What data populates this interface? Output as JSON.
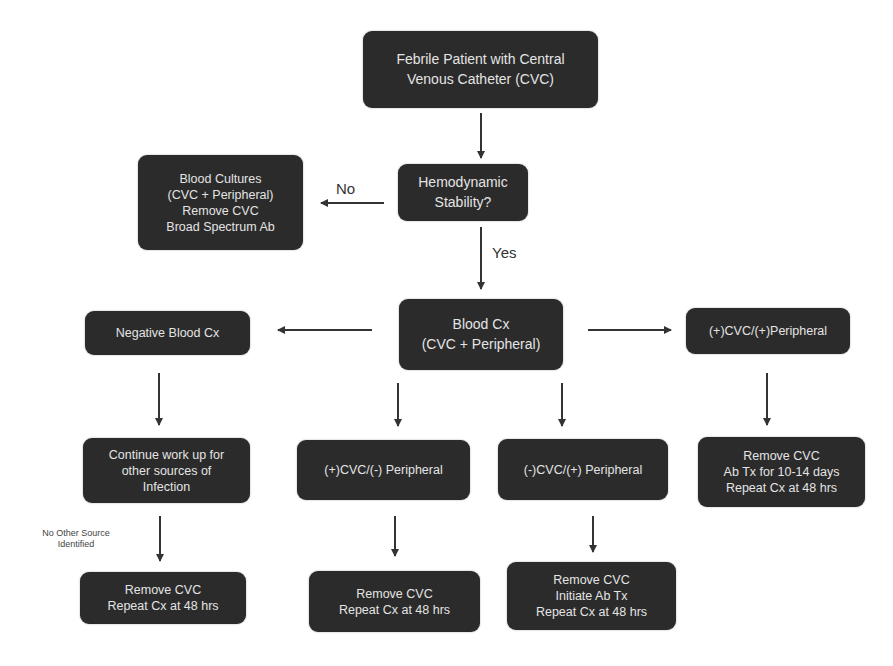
{
  "diagram": {
    "type": "flowchart",
    "nodes": {
      "start": {
        "lines": [
          "Febrile Patient with Central",
          "Venous Catheter (CVC)"
        ]
      },
      "hemodynamic": {
        "lines": [
          "Hemodynamic",
          "Stability?"
        ]
      },
      "unstable": {
        "lines": [
          "Blood Cultures",
          "(CVC + Peripheral)",
          "Remove CVC",
          "Broad Spectrum Ab"
        ]
      },
      "blood_cx": {
        "lines": [
          "Blood Cx",
          "(CVC + Peripheral)"
        ]
      },
      "negative": {
        "lines": [
          "Negative Blood Cx"
        ]
      },
      "pos_pos": {
        "lines": [
          "(+)CVC/(+)Peripheral"
        ]
      },
      "continue_workup": {
        "lines": [
          "Continue work up for",
          "other sources of",
          "Infection"
        ]
      },
      "pos_neg": {
        "lines": [
          "(+)CVC/(-) Peripheral"
        ]
      },
      "neg_pos": {
        "lines": [
          "(-)CVC/(+) Peripheral"
        ]
      },
      "pos_pos_action": {
        "lines": [
          "Remove CVC",
          "Ab Tx for 10-14 days",
          "Repeat Cx at 48 hrs"
        ]
      },
      "workup_action": {
        "lines": [
          "Remove CVC",
          "Repeat Cx at 48 hrs"
        ]
      },
      "pos_neg_action": {
        "lines": [
          "Remove CVC",
          "Repeat Cx at 48 hrs"
        ]
      },
      "neg_pos_action": {
        "lines": [
          "Remove CVC",
          "Initiate Ab Tx",
          "Repeat Cx at 48 hrs"
        ]
      }
    },
    "edge_labels": {
      "no": "No",
      "yes": "Yes",
      "no_other_source": [
        "No Other Source",
        "Identified"
      ]
    },
    "edges": [
      [
        "start",
        "hemodynamic"
      ],
      [
        "hemodynamic",
        "unstable",
        "No"
      ],
      [
        "hemodynamic",
        "blood_cx",
        "Yes"
      ],
      [
        "blood_cx",
        "negative"
      ],
      [
        "blood_cx",
        "pos_pos"
      ],
      [
        "blood_cx",
        "pos_neg"
      ],
      [
        "blood_cx",
        "neg_pos"
      ],
      [
        "negative",
        "continue_workup"
      ],
      [
        "pos_pos",
        "pos_pos_action"
      ],
      [
        "continue_workup",
        "workup_action",
        "No Other Source Identified"
      ],
      [
        "pos_neg",
        "pos_neg_action"
      ],
      [
        "neg_pos",
        "neg_pos_action"
      ]
    ],
    "colors": {
      "box": "#2b2b2b",
      "box_text": "#e4e4e4",
      "arrow": "#333333",
      "background": "#ffffff"
    }
  }
}
